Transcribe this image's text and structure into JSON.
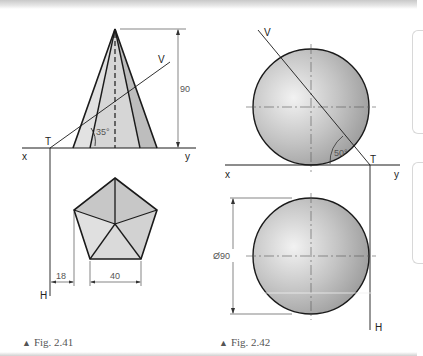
{
  "figures": [
    {
      "id": "fig-2-41",
      "caption": "Fig. 2.41",
      "labels": {
        "T": "T",
        "V": "V",
        "x": "x",
        "y": "y",
        "H": "H",
        "angle": "35°",
        "height_dim": "90",
        "offset_dim": "18",
        "side_dim": "40"
      }
    },
    {
      "id": "fig-2-42",
      "caption": "Fig. 2.42",
      "labels": {
        "T": "T",
        "V": "V",
        "x": "x",
        "y": "y",
        "H": "H",
        "angle": "50°",
        "diameter_dim": "Ø90"
      }
    }
  ],
  "colors": {
    "line": "#1a1a1a",
    "thin_line": "#333333",
    "cone_fill_light": "#dcdcdc",
    "cone_fill_dark": "#bdbdbd",
    "sphere_fill": "#b8b8b8",
    "caption_text": "#555555"
  }
}
